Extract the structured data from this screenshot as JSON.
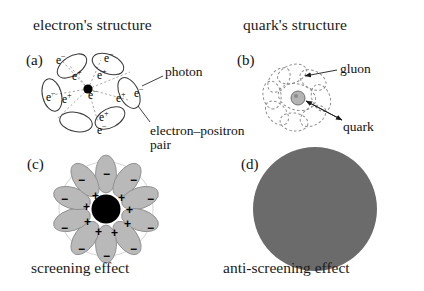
{
  "figure": {
    "background_color": "#ffffff",
    "ink_color": "#111111"
  },
  "panels": {
    "a": {
      "letter": "(a)",
      "title": "electron's structure",
      "core_color": "#000000",
      "ray_color": "#9a9a9a",
      "loop_color": "#4a4a4a",
      "annotations": [
        {
          "name": "photon",
          "text": "photon"
        },
        {
          "name": "electron-positron-pair-line1",
          "text": "electron–positron"
        },
        {
          "name": "electron-positron-pair-line2",
          "text": "pair"
        }
      ],
      "particles": [
        {
          "inner": "e",
          "inner_sign": "+",
          "outer": "e",
          "outer_sign": "−"
        }
      ],
      "particle_labels": {
        "positron": "e",
        "positron_sign": "+",
        "electron": "e",
        "electron_sign": "−"
      },
      "lobe_count": 6
    },
    "b": {
      "letter": "(b)",
      "title": "quark's structure",
      "core_color": "#b4b4b4",
      "loop_color": "#8d8d8d",
      "annotations": [
        {
          "name": "gluon",
          "text": "gluon"
        },
        {
          "name": "quark",
          "text": "quark"
        }
      ],
      "loop_count": 9
    },
    "c": {
      "letter": "(c)",
      "caption": "screening effect",
      "core_color": "#000000",
      "lobe_fill": "#b9b9b9",
      "halo_color": "#d9d9d9",
      "lobe_count": 10,
      "inner_charge": "+",
      "outer_charge": "−"
    },
    "d": {
      "letter": "(d)",
      "caption": "anti-screening effect",
      "disc_color": "#6b6b6b",
      "disc_radius_px": 62
    }
  }
}
